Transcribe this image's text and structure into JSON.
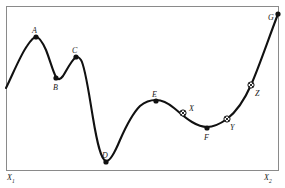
{
  "figure": {
    "type": "annotated-curve-diagram",
    "background_color": "#ffffff",
    "frame": {
      "stroke_color": "#8a8a8a",
      "stroke_width": 1,
      "x": 6,
      "y": 6,
      "width": 272,
      "height": 164
    },
    "curve": {
      "stroke_color": "#111111",
      "stroke_width": 2.1,
      "path": "M 6,88 C 12,76 20,56 27,46 C 31,40 34,37 36,37 C 39,37 42,41 46,50 C 50,60 53,72 56,77 C 58,80 60,80 63,76 C 67,70 71,61 75,58 C 77,56 79,57 81,60 C 85,66 88,88 93,118 C 97,142 101,160 106,161 C 110,162 115,152 120,140 C 127,124 133,113 140,106 C 146,101 151,100 156,100 C 162,100 168,103 174,108 C 179,112 185,118 192,122 C 197,125 202,127 207,127 C 213,127 220,124 227,119 C 236,112 244,101 251,85 C 259,67 268,40 278,14"
    }
  },
  "axis_labels": [
    {
      "id": "x1",
      "base": "X",
      "sub": "1",
      "x": 7,
      "y": 174
    },
    {
      "id": "x2",
      "base": "X",
      "sub": "2",
      "x": 264,
      "y": 174
    }
  ],
  "chart_data": {
    "type": "line",
    "title": "",
    "xlabel": "",
    "ylabel": "",
    "x_axis_range_labels": [
      "X1",
      "X2"
    ],
    "grid": false,
    "legend": false,
    "points": [
      {
        "label": "A",
        "marker": "filled-dot",
        "x": 36,
        "y": 37,
        "label_x": 32,
        "label_y": 27,
        "kind": "local-maximum"
      },
      {
        "label": "B",
        "marker": "filled-dot",
        "x": 56,
        "y": 78,
        "label_x": 53,
        "label_y": 84,
        "kind": "local-minimum"
      },
      {
        "label": "C",
        "marker": "filled-dot",
        "x": 76,
        "y": 57,
        "label_x": 72,
        "label_y": 47,
        "kind": "local-maximum"
      },
      {
        "label": "D",
        "marker": "filled-dot",
        "x": 106,
        "y": 162,
        "label_x": 102,
        "label_y": 152,
        "kind": "global-minimum"
      },
      {
        "label": "E",
        "marker": "filled-dot",
        "x": 156,
        "y": 101,
        "label_x": 152,
        "label_y": 91,
        "kind": "local-maximum"
      },
      {
        "label": "F",
        "marker": "filled-dot",
        "x": 207,
        "y": 128,
        "label_x": 204,
        "label_y": 134,
        "kind": "local-minimum"
      },
      {
        "label": "G",
        "marker": "filled-dot",
        "x": 278,
        "y": 14,
        "label_x": 268,
        "label_y": 14,
        "kind": "global-maximum"
      },
      {
        "label": "X",
        "marker": "crossed-circle",
        "x": 183,
        "y": 113,
        "label_x": 189,
        "label_y": 105,
        "kind": "inflection"
      },
      {
        "label": "Y",
        "marker": "crossed-circle",
        "x": 227,
        "y": 119,
        "label_x": 230,
        "label_y": 124,
        "kind": "inflection"
      },
      {
        "label": "Z",
        "marker": "crossed-circle",
        "x": 251,
        "y": 85,
        "label_x": 255,
        "label_y": 90,
        "kind": "inflection"
      }
    ]
  }
}
